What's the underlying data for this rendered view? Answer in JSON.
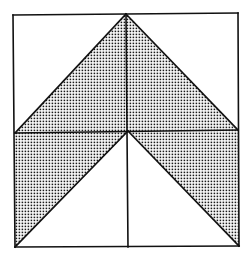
{
  "figure": {
    "colors": {
      "background": "#ffffff",
      "stroke": "#111111",
      "dot": "#1a1a1a"
    },
    "points": {
      "top_left": [
        13,
        15
      ],
      "top_apex": [
        126,
        14
      ],
      "top_right": [
        238,
        13
      ],
      "mid_left": [
        15,
        133
      ],
      "center": [
        128,
        131
      ],
      "mid_right": [
        238,
        130
      ],
      "bottom_left": [
        15,
        247
      ],
      "bottom_center": [
        128,
        247
      ],
      "bottom_right": [
        239,
        246
      ]
    },
    "shaded_regions": [
      {
        "name": "upper-triangle",
        "points": "126,14 238,130 128,131 15,133"
      },
      {
        "name": "lower-left-band",
        "points": "15,133 128,131 15,247"
      },
      {
        "name": "lower-right-band",
        "points": "128,131 238,130 239,246"
      }
    ],
    "pattern": "dot-grid"
  }
}
